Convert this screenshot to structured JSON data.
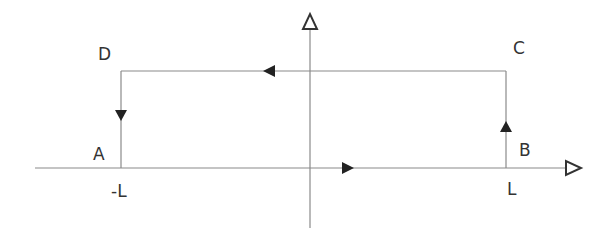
{
  "diagram": {
    "axes": {
      "horizontal": {
        "label": "",
        "arrow": "open-triangle-right"
      },
      "vertical": {
        "label": "",
        "arrow": "open-triangle-up"
      }
    },
    "points": [
      {
        "id": "A",
        "label": "A"
      },
      {
        "id": "B",
        "label": "B"
      },
      {
        "id": "C",
        "label": "C"
      },
      {
        "id": "D",
        "label": "D"
      }
    ],
    "ticks": [
      {
        "id": "neg_L",
        "label": "-L"
      },
      {
        "id": "pos_L",
        "label": "L"
      }
    ],
    "path": {
      "description": "Closed cycle A → B → C → D → A",
      "segments": [
        {
          "from": "A",
          "to": "B",
          "direction": "right"
        },
        {
          "from": "B",
          "to": "C",
          "direction": "up"
        },
        {
          "from": "C",
          "to": "D",
          "direction": "left"
        },
        {
          "from": "D",
          "to": "A",
          "direction": "down"
        }
      ]
    },
    "colors": {
      "line": "#8a8a8a",
      "arrow_fill": "#222222",
      "text": "#333333",
      "background": "#ffffff"
    }
  }
}
